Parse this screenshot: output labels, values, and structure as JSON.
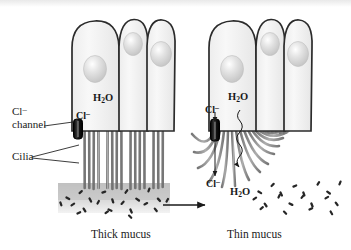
{
  "figure": {
    "title_band": "",
    "background_color": "#ffffff",
    "ink_color": "#1a1a1a"
  },
  "labels": {
    "cl_channel_line1": "Cl",
    "cl_channel_line1_sup": "–",
    "cl_channel_line2": "channel",
    "cilia": "Cilia"
  },
  "left_panel": {
    "caption": "Thick mucus",
    "h2o": {
      "text": "H",
      "sub": "2",
      "tail": "O"
    },
    "cl_ion": {
      "text": "Cl",
      "sup": "–"
    },
    "cell_count": 3,
    "cilia_state": "straight-vertical-matted",
    "mucus_state": "thick",
    "bacteria_count": 22,
    "channel_state": "closed"
  },
  "right_panel": {
    "caption": "Thin mucus",
    "h2o_top": {
      "text": "H",
      "sub": "2",
      "tail": "O"
    },
    "cl_top": {
      "text": "Cl",
      "sup": "–"
    },
    "cl_bottom": {
      "text": "Cl",
      "sup": "–"
    },
    "h2o_bottom": {
      "text": "H",
      "sub": "2",
      "tail": "O"
    },
    "cell_count": 3,
    "cilia_state": "splayed-curved-beating",
    "mucus_state": "thin",
    "bacteria_count": 20,
    "channel_state": "open"
  },
  "transition": {
    "arrow": "→",
    "direction": "left-to-right"
  },
  "colors": {
    "cell_fill": "#f4f4f4",
    "cell_outline": "#2b2b2b",
    "nucleus": "#dcdcdc",
    "cilia": "#8a8a8a",
    "mucus_gray": "#c9c9c9",
    "bacteria": "#2a2a2a",
    "channel": "#1a1a1a"
  }
}
